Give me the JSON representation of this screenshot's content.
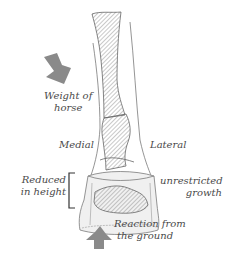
{
  "diagram": {
    "type": "anatomical-illustration",
    "labels": {
      "weight_line1": "Weight of",
      "weight_line2": "horse",
      "medial": "Medial",
      "lateral": "Lateral",
      "reduced_line1": "Reduced",
      "reduced_line2": "in height",
      "unrestricted_line1": "unrestricted",
      "unrestricted_line2": "growth",
      "reaction_line1": "Reaction from",
      "reaction_line2": "the ground"
    },
    "arrows": [
      {
        "name": "weight-of-horse-arrow",
        "direction": "down-right"
      },
      {
        "name": "reaction-from-ground-arrow",
        "direction": "up"
      }
    ],
    "colors": {
      "arrow": "#8a8a8a",
      "outline": "#6e6e6e",
      "hatch": "#777777",
      "text": "#4a4a4a",
      "bracket": "#333333"
    }
  }
}
